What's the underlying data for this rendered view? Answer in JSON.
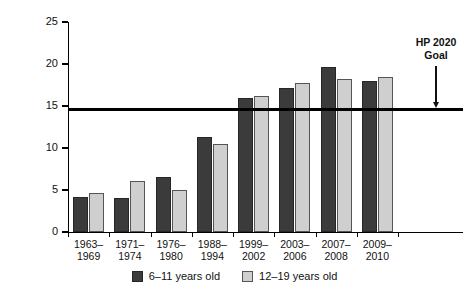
{
  "chart_data": {
    "type": "bar",
    "title": "",
    "subtitle": "",
    "xlabel": "",
    "ylabel": "Percent obese",
    "ylim": [
      0,
      25
    ],
    "yticks": [
      0,
      5,
      10,
      15,
      20,
      25
    ],
    "ytick_labels": [
      "0",
      "5",
      "10",
      "15",
      "20",
      "25"
    ],
    "grid": false,
    "legend_position": "bottom",
    "categories": [
      "1963–\n1969",
      "1971–\n1974",
      "1976–\n1980",
      "1988–\n1994",
      "1999–\n2002",
      "2003–\n2006",
      "2007–\n2008",
      "2009–\n2010"
    ],
    "category_lines": [
      [
        "1963–",
        "1969"
      ],
      [
        "1971–",
        "1974"
      ],
      [
        "1976–",
        "1980"
      ],
      [
        "1988–",
        "1994"
      ],
      [
        "1999–",
        "2002"
      ],
      [
        "2003–",
        "2006"
      ],
      [
        "2007–",
        "2008"
      ],
      [
        "2009–",
        "2010"
      ]
    ],
    "series": [
      {
        "name": "6–11 years old",
        "color": "#3b3b3b",
        "values": [
          4.2,
          4.0,
          6.5,
          11.3,
          15.9,
          17.1,
          19.6,
          18.0
        ]
      },
      {
        "name": "12–19 years old",
        "color": "#cfcfcf",
        "values": [
          4.6,
          6.1,
          5.0,
          10.5,
          16.2,
          17.7,
          18.2,
          18.4
        ]
      }
    ],
    "reference_line": {
      "label_line1": "HP 2020",
      "label_line2": "Goal",
      "value": 14.6,
      "color": "#000000"
    }
  },
  "legend": {
    "items": [
      {
        "label": "6–11 years old"
      },
      {
        "label": "12–19 years old"
      }
    ]
  }
}
